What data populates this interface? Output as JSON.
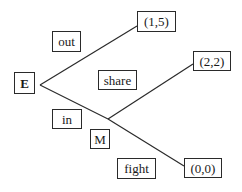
{
  "diagram": {
    "type": "game-tree",
    "nodes": [
      {
        "id": "E",
        "label": "E",
        "kind": "decision"
      },
      {
        "id": "M",
        "label": "M",
        "kind": "decision"
      }
    ],
    "actions": [
      {
        "id": "out",
        "label": "out",
        "from": "E",
        "to": "payoff_1"
      },
      {
        "id": "in",
        "label": "in",
        "from": "E",
        "to": "M"
      },
      {
        "id": "share",
        "label": "share",
        "from": "M",
        "to": "payoff_2"
      },
      {
        "id": "fight",
        "label": "fight",
        "from": "M",
        "to": "payoff_3"
      }
    ],
    "payoffs": [
      {
        "id": "payoff_1",
        "label": "(1,5)"
      },
      {
        "id": "payoff_2",
        "label": "(2,2)"
      },
      {
        "id": "payoff_3",
        "label": "(0,0)"
      }
    ],
    "colors": {
      "line": "#2a2a2a",
      "background": "#ffffff",
      "text": "#1a1a1a"
    }
  }
}
